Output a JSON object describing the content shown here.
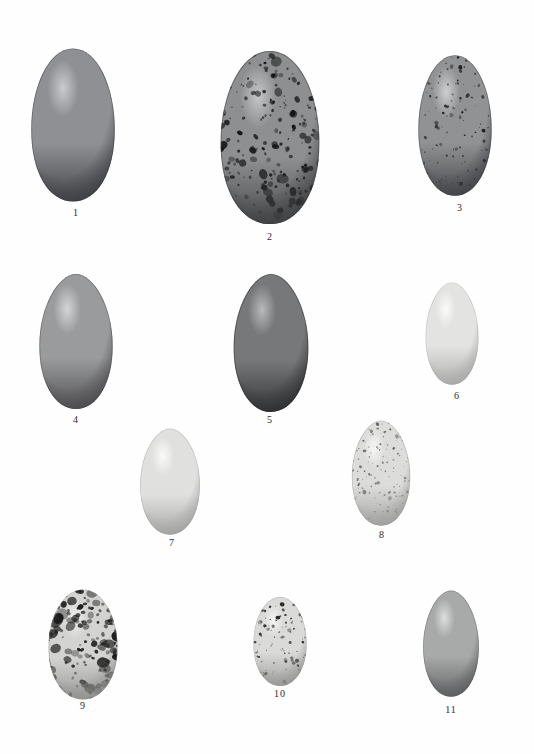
{
  "plate": {
    "title": "Plate of bird eggs",
    "background_color": "#fefefe",
    "label_color": "#2b2b2b",
    "width": 534,
    "height": 754,
    "rows": 3,
    "egg_count": 11
  },
  "eggs": [
    {
      "label": "1",
      "x": 18,
      "y": 45,
      "w": 110,
      "h": 160,
      "label_x": 56,
      "label_y": 207,
      "base_color": "#8f9094",
      "shadow_color": "#3a3c40",
      "highlight_color": "#c9cbcd",
      "pattern": "plain",
      "speckle_count": 0,
      "speckle_color": "#1a1a1a",
      "shape": "oval-broad"
    },
    {
      "label": "2",
      "x": 205,
      "y": 47,
      "w": 130,
      "h": 181,
      "label_x": 250,
      "label_y": 231,
      "base_color": "#8d8f90",
      "shadow_color": "#3c3e40",
      "highlight_color": "#c4c6c7",
      "pattern": "heavy-speckled",
      "speckle_count": 260,
      "speckle_color": "#111111",
      "shape": "oval-broad"
    },
    {
      "label": "3",
      "x": 404,
      "y": 52,
      "w": 102,
      "h": 147,
      "label_x": 440,
      "label_y": 202,
      "base_color": "#909294",
      "shadow_color": "#3f4144",
      "highlight_color": "#cdcfd0",
      "pattern": "fine-speckled",
      "speckle_count": 150,
      "speckle_color": "#151515",
      "shape": "oval"
    },
    {
      "label": "4",
      "x": 22,
      "y": 272,
      "w": 108,
      "h": 140,
      "label_x": 56,
      "label_y": 414,
      "base_color": "#9a9b9c",
      "shadow_color": "#49494b",
      "highlight_color": "#d4d5d6",
      "pattern": "plain",
      "speckle_count": 0,
      "speckle_color": "#1a1a1a",
      "shape": "pyriform"
    },
    {
      "label": "5",
      "x": 216,
      "y": 272,
      "w": 110,
      "h": 143,
      "label_x": 250,
      "label_y": 414,
      "base_color": "#76787a",
      "shadow_color": "#2b2d2f",
      "highlight_color": "#b9babb",
      "pattern": "plain",
      "speckle_count": 0,
      "speckle_color": "#1a1a1a",
      "shape": "pyriform"
    },
    {
      "label": "6",
      "x": 413,
      "y": 281,
      "w": 78,
      "h": 106,
      "label_x": 437,
      "label_y": 390,
      "base_color": "#e3e3e2",
      "shadow_color": "#a6a6a5",
      "highlight_color": "#fbfbfb",
      "pattern": "plain",
      "speckle_count": 0,
      "speckle_color": "#1a1a1a",
      "shape": "pyriform"
    },
    {
      "label": "7",
      "x": 126,
      "y": 427,
      "w": 88,
      "h": 110,
      "label_x": 152,
      "label_y": 537,
      "base_color": "#e0e0df",
      "shadow_color": "#a0a09f",
      "highlight_color": "#fafafa",
      "pattern": "plain",
      "speckle_count": 0,
      "speckle_color": "#1a1a1a",
      "shape": "pyriform"
    },
    {
      "label": "8",
      "x": 338,
      "y": 419,
      "w": 86,
      "h": 109,
      "label_x": 362,
      "label_y": 529,
      "base_color": "#dcdcda",
      "shadow_color": "#9d9d9b",
      "highlight_color": "#f7f7f6",
      "pattern": "fine-speckled",
      "speckle_count": 210,
      "speckle_color": "#5c5c58",
      "shape": "pyriform"
    },
    {
      "label": "9",
      "x": 35,
      "y": 587,
      "w": 96,
      "h": 115,
      "label_x": 63,
      "label_y": 700,
      "base_color": "#d3d3d1",
      "shadow_color": "#8e8e8c",
      "highlight_color": "#f0f0ef",
      "pattern": "blotched",
      "speckle_count": 170,
      "speckle_color": "#121212",
      "shape": "oval"
    },
    {
      "label": "10",
      "x": 243,
      "y": 595,
      "w": 74,
      "h": 93,
      "label_x": 260,
      "label_y": 688,
      "base_color": "#dadad8",
      "shadow_color": "#969694",
      "highlight_color": "#f4f4f3",
      "pattern": "speckled",
      "speckle_count": 130,
      "speckle_color": "#1c1c1c",
      "shape": "oval"
    },
    {
      "label": "11",
      "x": 410,
      "y": 589,
      "w": 82,
      "h": 110,
      "label_x": 431,
      "label_y": 704,
      "base_color": "#a8a9a9",
      "shadow_color": "#5a5b5c",
      "highlight_color": "#dcdddd",
      "pattern": "plain",
      "speckle_count": 0,
      "speckle_color": "#1a1a1a",
      "shape": "pyriform"
    }
  ]
}
